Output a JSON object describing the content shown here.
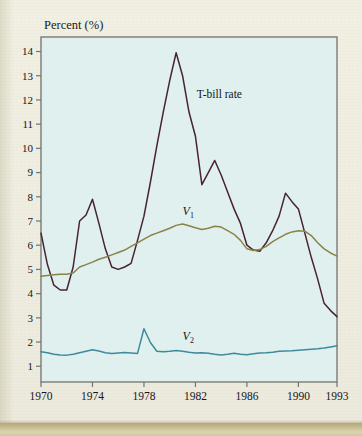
{
  "figure": {
    "background_color": "#efeee0",
    "plot_background_color": "#dff0ef",
    "plot_border_color": "#7b7b78"
  },
  "chart_data": {
    "type": "line",
    "title": "",
    "ylabel": "Percent (%)",
    "xlabel": "",
    "xlim": [
      1970,
      1993
    ],
    "ylim": [
      0.35,
      14.6
    ],
    "grid": false,
    "legend_position": "inline-annotations",
    "x_ticks": [
      1970,
      1974,
      1978,
      1982,
      1986,
      1990,
      1993
    ],
    "x_tick_labels": [
      "1970",
      "1974",
      "1978",
      "1982",
      "1986",
      "1990",
      "1993"
    ],
    "y_ticks": [
      1,
      2,
      3,
      4,
      5,
      6,
      7,
      8,
      9,
      10,
      11,
      12,
      13,
      14
    ],
    "y_tick_labels": [
      "1",
      "2",
      "3",
      "4",
      "5",
      "6",
      "7",
      "8",
      "9",
      "10",
      "11",
      "12",
      "13",
      "14"
    ],
    "x": [
      1970,
      1970.5,
      1971,
      1971.5,
      1972,
      1972.5,
      1973,
      1973.5,
      1974,
      1974.5,
      1975,
      1975.5,
      1976,
      1976.5,
      1977,
      1977.5,
      1978,
      1978.5,
      1979,
      1979.5,
      1980,
      1980.5,
      1981,
      1981.5,
      1982,
      1982.5,
      1983,
      1983.5,
      1984,
      1984.5,
      1985,
      1985.5,
      1986,
      1986.5,
      1987,
      1987.5,
      1988,
      1988.5,
      1989,
      1989.5,
      1990,
      1990.5,
      1991,
      1991.5,
      1992,
      1992.5,
      1993
    ],
    "series": [
      {
        "name": "T-bill rate",
        "label": "T-bill rate",
        "color": "#4a2230",
        "label_x": 1982.1,
        "label_y": 12.1,
        "values": [
          6.5,
          5.2,
          4.35,
          4.15,
          4.15,
          5.1,
          7.0,
          7.25,
          7.9,
          6.9,
          5.85,
          5.1,
          5.0,
          5.1,
          5.25,
          6.2,
          7.2,
          8.6,
          10.1,
          11.5,
          12.8,
          13.95,
          13.0,
          11.5,
          10.5,
          8.5,
          9.0,
          9.5,
          8.9,
          8.2,
          7.5,
          6.9,
          6.0,
          5.8,
          5.75,
          6.1,
          6.6,
          7.2,
          8.15,
          7.8,
          7.5,
          6.5,
          5.5,
          4.6,
          3.6,
          3.3,
          3.05
        ]
      },
      {
        "name": "V1",
        "label": "V₁",
        "color": "#8a8347",
        "label_x": 1981.0,
        "label_y": 7.25,
        "values": [
          4.72,
          4.75,
          4.78,
          4.8,
          4.8,
          4.85,
          5.1,
          5.2,
          5.3,
          5.42,
          5.5,
          5.6,
          5.7,
          5.8,
          5.95,
          6.1,
          6.25,
          6.4,
          6.5,
          6.6,
          6.7,
          6.82,
          6.88,
          6.8,
          6.72,
          6.65,
          6.7,
          6.78,
          6.75,
          6.6,
          6.45,
          6.2,
          5.85,
          5.78,
          5.82,
          5.95,
          6.15,
          6.3,
          6.45,
          6.55,
          6.6,
          6.58,
          6.4,
          6.1,
          5.85,
          5.68,
          5.55
        ]
      },
      {
        "name": "V2",
        "label": "V₂",
        "color": "#3d8a9c",
        "label_x": 1981.0,
        "label_y": 2.1,
        "values": [
          1.6,
          1.56,
          1.5,
          1.47,
          1.46,
          1.5,
          1.56,
          1.62,
          1.68,
          1.63,
          1.56,
          1.53,
          1.55,
          1.57,
          1.55,
          1.53,
          2.55,
          1.98,
          1.62,
          1.6,
          1.62,
          1.65,
          1.62,
          1.58,
          1.55,
          1.56,
          1.54,
          1.5,
          1.47,
          1.5,
          1.54,
          1.5,
          1.48,
          1.52,
          1.55,
          1.56,
          1.58,
          1.62,
          1.63,
          1.64,
          1.66,
          1.68,
          1.7,
          1.72,
          1.75,
          1.8,
          1.85
        ]
      }
    ]
  },
  "labels": {
    "y_axis_title": "Percent (%)",
    "tbill": "T-bill rate",
    "v1_base": "V",
    "v1_sub": "1",
    "v2_base": "V",
    "v2_sub": "2"
  }
}
